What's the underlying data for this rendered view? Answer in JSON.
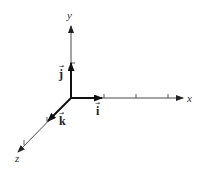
{
  "diagram": {
    "axes": [
      {
        "name": "x",
        "label": "x"
      },
      {
        "name": "y",
        "label": "y"
      },
      {
        "name": "z",
        "label": "z"
      }
    ],
    "unit_vectors": [
      {
        "name": "i",
        "label": "i",
        "axis": "x"
      },
      {
        "name": "j",
        "label": "j",
        "axis": "y"
      },
      {
        "name": "k",
        "label": "k",
        "axis": "z"
      }
    ],
    "colors": {
      "axis": "#333333",
      "vector": "#111111"
    }
  }
}
